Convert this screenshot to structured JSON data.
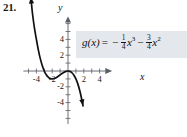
{
  "problem": {
    "number": "21."
  },
  "formula": {
    "function_name": "g(x)",
    "equals": "=",
    "term1_sign": "−",
    "term1_num": "1",
    "term1_den": "4",
    "term1_var": "x",
    "term1_power": "3",
    "term2_sign": "−",
    "term2_num": "3",
    "term2_den": "4",
    "term2_var": "x",
    "term2_power": "2",
    "plain": "g(x) = -1/4 x^3 - 3/4 x^2",
    "box_color": "#e4e8ec"
  },
  "axes": {
    "x_label": "x",
    "y_label": "y",
    "x_tick_labels": [
      "-4",
      "-2",
      "2",
      "4"
    ],
    "x_tick_values": [
      -4,
      -2,
      2,
      4
    ],
    "y_tick_labels": [
      "4",
      "2",
      "-2",
      "-4"
    ],
    "y_tick_values": [
      4,
      2,
      -2,
      -4
    ],
    "color": "#5a5f66"
  },
  "chart_data": {
    "type": "line",
    "title": "",
    "subtitle": "",
    "xlabel": "x",
    "ylabel": "y",
    "xlim": [
      -5.4,
      5.6
    ],
    "ylim": [
      -6.2,
      6.4
    ],
    "grid": false,
    "legend": false,
    "xticks": [
      -4,
      -2,
      2,
      4
    ],
    "yticks": [
      -4,
      -2,
      2,
      4
    ],
    "minor_tick_step": 1,
    "annotations": [
      "g(x) = -1/4 x^3 - 3/4 x^2"
    ],
    "series": [
      {
        "name": "g(x) = -1/4 x^3 - 3/4 x^2",
        "equation": "y = -0.25*x^3 - 0.75*x^2",
        "color": "#111111",
        "arrow_start": true,
        "arrow_end": true,
        "x": [
          -4.7,
          -4.5,
          -4.25,
          -4,
          -3.75,
          -3.5,
          -3.25,
          -3,
          -2.75,
          -2.5,
          -2.25,
          -2,
          -1.75,
          -1.5,
          -1.25,
          -1,
          -0.75,
          -0.5,
          -0.25,
          0,
          0.25,
          0.5,
          0.75,
          1,
          1.25,
          1.5,
          1.75,
          1.9
        ],
        "y": [
          9.36,
          7.31,
          5.45,
          4.0,
          2.64,
          1.53,
          0.66,
          0.0,
          -0.47,
          -0.78,
          -0.95,
          -1.0,
          -0.95,
          -0.84,
          -0.68,
          -0.5,
          -0.32,
          -0.16,
          -0.04,
          0.0,
          -0.05,
          -0.22,
          -0.53,
          -1.0,
          -1.66,
          -2.53,
          -3.64,
          -4.41
        ]
      }
    ],
    "key_points": [
      {
        "label": "x-intercept",
        "x": -3,
        "y": 0
      },
      {
        "label": "local minimum",
        "x": -2,
        "y": -1
      },
      {
        "label": "inflection / origin",
        "x": 0,
        "y": 0
      }
    ]
  }
}
